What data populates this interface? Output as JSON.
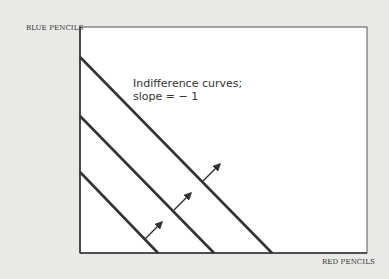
{
  "diagram": {
    "y_axis_label": "BLUE PENCILS",
    "x_axis_label": "RED PENCILS",
    "annotation_line1": "Indifference curves;",
    "annotation_line2": "slope = − 1",
    "colors": {
      "background": "#e9e9e7",
      "plot": "#ffffff",
      "line": "#333333"
    },
    "curves": [
      {
        "x1": 80,
        "y1": 57,
        "x2": 272,
        "y2": 253
      },
      {
        "x1": 80,
        "y1": 116,
        "x2": 214,
        "y2": 253
      },
      {
        "x1": 80,
        "y1": 172,
        "x2": 158,
        "y2": 253
      }
    ],
    "arrows": [
      {
        "x1": 145,
        "y1": 239,
        "x2": 162,
        "y2": 222
      },
      {
        "x1": 174,
        "y1": 210,
        "x2": 191,
        "y2": 193
      },
      {
        "x1": 203,
        "y1": 181,
        "x2": 220,
        "y2": 164
      }
    ]
  }
}
